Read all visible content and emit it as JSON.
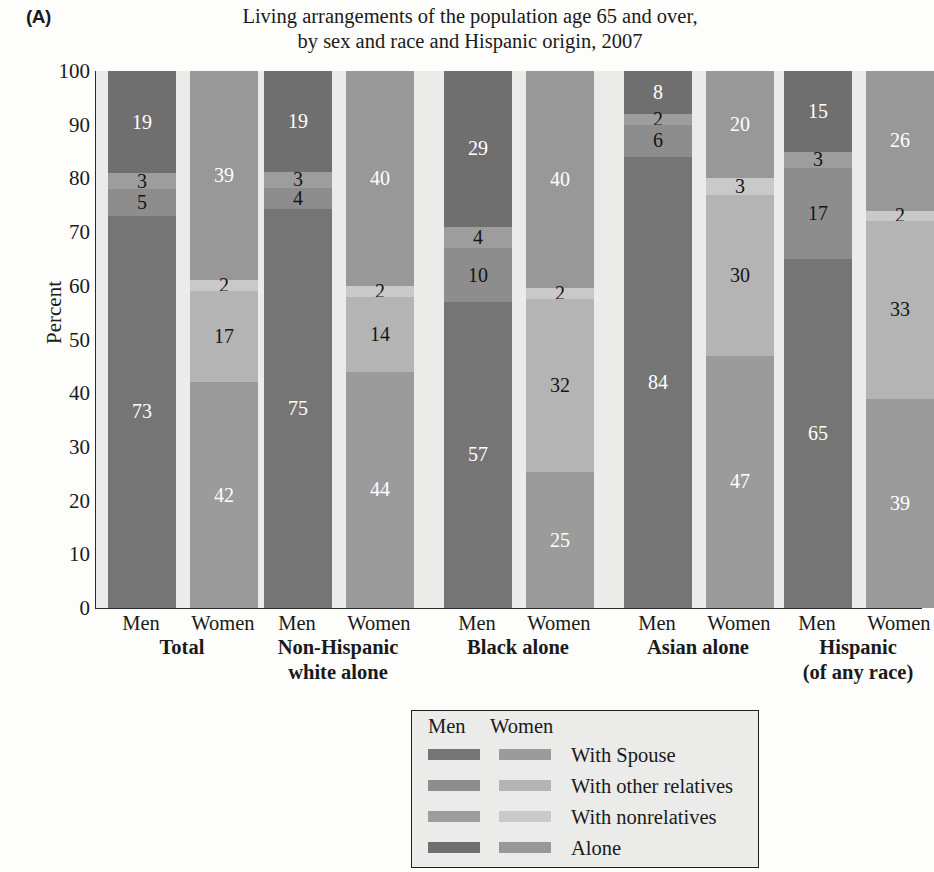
{
  "panel_letter": "(A)",
  "title_lines": [
    "Living arrangements of the population age 65 and over,",
    "by sex and race and Hispanic origin, 2007"
  ],
  "axis": {
    "ylabel": "Percent",
    "yticks": [
      "100",
      "90",
      "80",
      "70",
      "60",
      "50",
      "40",
      "30",
      "20",
      "10",
      "0"
    ],
    "ylim": [
      0,
      100
    ]
  },
  "legend": {
    "header_men": "Men",
    "header_women": "Women",
    "rows": [
      {
        "label": "With Spouse",
        "men_color": "#757575",
        "women_color": "#9b9b9b"
      },
      {
        "label": "With other relatives",
        "men_color": "#8d8d8d",
        "women_color": "#b4b4b4"
      },
      {
        "label": "With nonrelatives",
        "men_color": "#9d9d9d",
        "women_color": "#c9c9c9"
      },
      {
        "label": "Alone",
        "men_color": "#6f6f6f",
        "women_color": "#989898"
      }
    ]
  },
  "colors": {
    "plot_background": "#ebebe9",
    "page_background": "#fdfdfb",
    "axis": "#2a2a2a",
    "men_spouse": "#757575",
    "men_other_relatives": "#8d8d8d",
    "men_nonrelatives": "#9d9d9d",
    "men_alone": "#6f6f6f",
    "women_spouse": "#9b9b9b",
    "women_other_relatives": "#b4b4b4",
    "women_nonrelatives": "#c9c9c9",
    "women_alone": "#989898"
  },
  "chart_data": {
    "type": "bar",
    "subtype": "stacked-percent",
    "xlabel": "",
    "ylabel": "Percent",
    "ylim": [
      0,
      100
    ],
    "grid": false,
    "legend_position": "below-plot",
    "categories": [
      "Total",
      "Non-Hispanic white alone",
      "Black alone",
      "Asian alone",
      "Hispanic (of any race)"
    ],
    "subcategories": [
      "Men",
      "Women"
    ],
    "stack_order_bottom_to_top": [
      "With Spouse",
      "With other relatives",
      "With nonrelatives",
      "Alone"
    ],
    "series": [
      {
        "name": "With Spouse",
        "men": [
          73,
          75,
          57,
          84,
          65
        ],
        "women": [
          42,
          44,
          25,
          47,
          39
        ]
      },
      {
        "name": "With other relatives",
        "men": [
          5,
          4,
          10,
          6,
          17
        ],
        "women": [
          17,
          14,
          32,
          30,
          33
        ]
      },
      {
        "name": "With nonrelatives",
        "men": [
          3,
          3,
          4,
          2,
          3
        ],
        "women": [
          2,
          2,
          2,
          3,
          2
        ]
      },
      {
        "name": "Alone",
        "men": [
          19,
          19,
          29,
          8,
          15
        ],
        "women": [
          39,
          40,
          40,
          20,
          26
        ]
      }
    ]
  },
  "groups": [
    {
      "name_lines": [
        "Total"
      ],
      "men": {
        "sex": "Men",
        "segments": [
          {
            "key": "With Spouse",
            "value": 73,
            "label": "73",
            "color": "#757575",
            "label_color": "light"
          },
          {
            "key": "With other relatives",
            "value": 5,
            "label": "5",
            "color": "#8d8d8d",
            "label_color": "dark"
          },
          {
            "key": "With nonrelatives",
            "value": 3,
            "label": "3",
            "color": "#9d9d9d",
            "label_color": "dark"
          },
          {
            "key": "Alone",
            "value": 19,
            "label": "19",
            "color": "#6f6f6f",
            "label_color": "light"
          }
        ]
      },
      "women": {
        "sex": "Women",
        "segments": [
          {
            "key": "With Spouse",
            "value": 42,
            "label": "42",
            "color": "#9b9b9b",
            "label_color": "light"
          },
          {
            "key": "With other relatives",
            "value": 17,
            "label": "17",
            "color": "#b4b4b4",
            "label_color": "dark"
          },
          {
            "key": "With nonrelatives",
            "value": 2,
            "label": "2",
            "color": "#c9c9c9",
            "label_color": "dark"
          },
          {
            "key": "Alone",
            "value": 39,
            "label": "39",
            "color": "#989898",
            "label_color": "light"
          }
        ]
      }
    },
    {
      "name_lines": [
        "Non-Hispanic",
        "white alone"
      ],
      "men": {
        "sex": "Men",
        "segments": [
          {
            "key": "With Spouse",
            "value": 75,
            "label": "75",
            "color": "#757575",
            "label_color": "light"
          },
          {
            "key": "With other relatives",
            "value": 4,
            "label": "4",
            "color": "#8d8d8d",
            "label_color": "dark"
          },
          {
            "key": "With nonrelatives",
            "value": 3,
            "label": "3",
            "color": "#9d9d9d",
            "label_color": "dark"
          },
          {
            "key": "Alone",
            "value": 19,
            "label": "19",
            "color": "#6f6f6f",
            "label_color": "light"
          }
        ]
      },
      "women": {
        "sex": "Women",
        "segments": [
          {
            "key": "With Spouse",
            "value": 44,
            "label": "44",
            "color": "#9b9b9b",
            "label_color": "light"
          },
          {
            "key": "With other relatives",
            "value": 14,
            "label": "14",
            "color": "#b4b4b4",
            "label_color": "dark"
          },
          {
            "key": "With nonrelatives",
            "value": 2,
            "label": "2",
            "color": "#c9c9c9",
            "label_color": "dark"
          },
          {
            "key": "Alone",
            "value": 40,
            "label": "40",
            "color": "#989898",
            "label_color": "light"
          }
        ]
      }
    },
    {
      "name_lines": [
        "Black alone"
      ],
      "men": {
        "sex": "Men",
        "segments": [
          {
            "key": "With Spouse",
            "value": 57,
            "label": "57",
            "color": "#757575",
            "label_color": "light"
          },
          {
            "key": "With other relatives",
            "value": 10,
            "label": "10",
            "color": "#8d8d8d",
            "label_color": "dark"
          },
          {
            "key": "With nonrelatives",
            "value": 4,
            "label": "4",
            "color": "#9d9d9d",
            "label_color": "dark"
          },
          {
            "key": "Alone",
            "value": 29,
            "label": "29",
            "color": "#6f6f6f",
            "label_color": "light"
          }
        ]
      },
      "women": {
        "sex": "Women",
        "segments": [
          {
            "key": "With Spouse",
            "value": 25,
            "label": "25",
            "color": "#9b9b9b",
            "label_color": "light"
          },
          {
            "key": "With other relatives",
            "value": 32,
            "label": "32",
            "color": "#b4b4b4",
            "label_color": "dark"
          },
          {
            "key": "With nonrelatives",
            "value": 2,
            "label": "2",
            "color": "#c9c9c9",
            "label_color": "dark"
          },
          {
            "key": "Alone",
            "value": 40,
            "label": "40",
            "color": "#989898",
            "label_color": "light"
          }
        ]
      }
    },
    {
      "name_lines": [
        "Asian alone"
      ],
      "men": {
        "sex": "Men",
        "segments": [
          {
            "key": "With Spouse",
            "value": 84,
            "label": "84",
            "color": "#757575",
            "label_color": "light"
          },
          {
            "key": "With other relatives",
            "value": 6,
            "label": "6",
            "color": "#8d8d8d",
            "label_color": "dark"
          },
          {
            "key": "With nonrelatives",
            "value": 2,
            "label": "2",
            "color": "#9d9d9d",
            "label_color": "dark"
          },
          {
            "key": "Alone",
            "value": 8,
            "label": "8",
            "color": "#6f6f6f",
            "label_color": "light"
          }
        ]
      },
      "women": {
        "sex": "Women",
        "segments": [
          {
            "key": "With Spouse",
            "value": 47,
            "label": "47",
            "color": "#9b9b9b",
            "label_color": "light"
          },
          {
            "key": "With other relatives",
            "value": 30,
            "label": "30",
            "color": "#b4b4b4",
            "label_color": "dark"
          },
          {
            "key": "With nonrelatives",
            "value": 3,
            "label": "3",
            "color": "#c9c9c9",
            "label_color": "dark"
          },
          {
            "key": "Alone",
            "value": 20,
            "label": "20",
            "color": "#989898",
            "label_color": "light"
          }
        ]
      }
    },
    {
      "name_lines": [
        "Hispanic",
        "(of any race)"
      ],
      "men": {
        "sex": "Men",
        "segments": [
          {
            "key": "With Spouse",
            "value": 65,
            "label": "65",
            "color": "#757575",
            "label_color": "light"
          },
          {
            "key": "With other relatives",
            "value": 17,
            "label": "17",
            "color": "#8d8d8d",
            "label_color": "dark"
          },
          {
            "key": "With nonrelatives",
            "value": 3,
            "label": "3",
            "color": "#9d9d9d",
            "label_color": "dark"
          },
          {
            "key": "Alone",
            "value": 15,
            "label": "15",
            "color": "#6f6f6f",
            "label_color": "light"
          }
        ]
      },
      "women": {
        "sex": "Women",
        "segments": [
          {
            "key": "With Spouse",
            "value": 39,
            "label": "39",
            "color": "#9b9b9b",
            "label_color": "light"
          },
          {
            "key": "With other relatives",
            "value": 33,
            "label": "33",
            "color": "#b4b4b4",
            "label_color": "dark"
          },
          {
            "key": "With nonrelatives",
            "value": 2,
            "label": "2",
            "color": "#c9c9c9",
            "label_color": "dark"
          },
          {
            "key": "Alone",
            "value": 26,
            "label": "26",
            "color": "#989898",
            "label_color": "light"
          }
        ]
      }
    }
  ]
}
